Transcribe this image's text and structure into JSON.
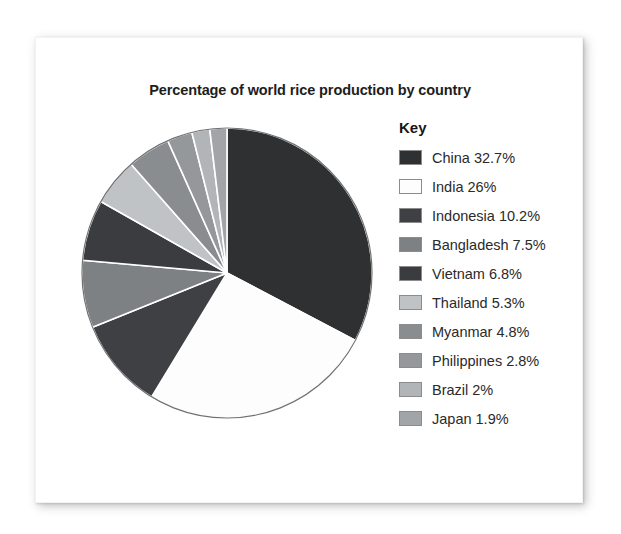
{
  "card": {
    "background": "#ffffff"
  },
  "chart_data": {
    "type": "pie",
    "title": "Percentage of world rice production by country",
    "xlabel": "",
    "ylabel": "",
    "legend_position": "right",
    "legend_title": "Key",
    "units": "percent",
    "start_angle_deg": 0,
    "direction": "clockwise",
    "categories": [
      "China",
      "India",
      "Indonesia",
      "Bangladesh",
      "Vietnam",
      "Thailand",
      "Myanmar",
      "Philippines",
      "Brazil",
      "Japan"
    ],
    "values": [
      32.7,
      26,
      10.2,
      7.5,
      6.8,
      5.3,
      4.8,
      2.8,
      2,
      1.9
    ],
    "value_labels": [
      "32.7%",
      "26%",
      "10.2%",
      "7.5%",
      "6.8%",
      "5.3%",
      "4.8%",
      "2.8%",
      "2%",
      "1.9%"
    ],
    "colors": [
      "#2f3032",
      "#fdfdfd",
      "#3e4043",
      "#7e8184",
      "#3a3c3f",
      "#c0c3c5",
      "#8a8d90",
      "#95989a",
      "#b2b5b7",
      "#a2a5a8"
    ],
    "slice_order_on_pie": [
      "China",
      "India",
      "Indonesia",
      "Bangladesh",
      "Vietnam",
      "Thailand",
      "Myanmar",
      "Philippines",
      "Brazil",
      "Japan"
    ],
    "total": 100
  },
  "legend": {
    "title": "Key",
    "items": [
      {
        "label": "China 32.7%",
        "color": "#2f3032",
        "name": "China",
        "value": "32.7%"
      },
      {
        "label": "India 26%",
        "color": "#fdfdfd",
        "name": "India",
        "value": "26%"
      },
      {
        "label": "Indonesia 10.2%",
        "color": "#3e4043",
        "name": "Indonesia",
        "value": "10.2%"
      },
      {
        "label": "Bangladesh 7.5%",
        "color": "#7e8184",
        "name": "Bangladesh",
        "value": "7.5%"
      },
      {
        "label": "Vietnam 6.8%",
        "color": "#3a3c3f",
        "name": "Vietnam",
        "value": "6.8%"
      },
      {
        "label": "Thailand 5.3%",
        "color": "#c0c3c5",
        "name": "Thailand",
        "value": "5.3%"
      },
      {
        "label": "Myanmar 4.8%",
        "color": "#8a8d90",
        "name": "Myanmar",
        "value": "4.8%"
      },
      {
        "label": "Philippines 2.8%",
        "color": "#95989a",
        "name": "Philippines",
        "value": "2.8%"
      },
      {
        "label": "Brazil 2%",
        "color": "#b2b5b7",
        "name": "Brazil",
        "value": "2%"
      },
      {
        "label": "Japan 1.9%",
        "color": "#a2a5a8",
        "name": "Japan",
        "value": "1.9%"
      }
    ]
  },
  "pie_geometry": {
    "cx": 146,
    "cy": 146,
    "r": 145,
    "outline_color": "#6f7274",
    "separator_color": "#ffffff"
  }
}
